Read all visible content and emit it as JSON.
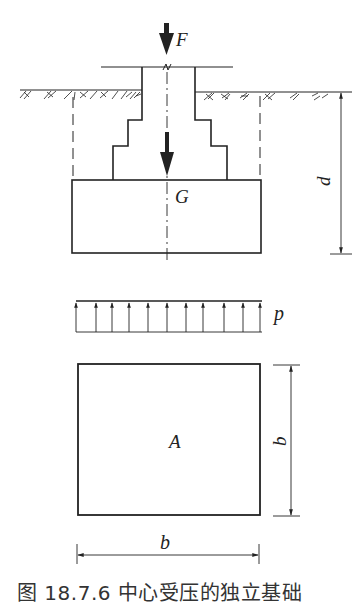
{
  "figure": {
    "caption": "图 18.7.6   中心受压的独立基础",
    "labels": {
      "force_top": "F",
      "self_weight": "G",
      "depth": "d",
      "pressure": "p",
      "area": "A",
      "width_vertical": "b",
      "width_horizontal": "b"
    },
    "colors": {
      "line": "#222222",
      "background": "#ffffff"
    },
    "elevation_view": {
      "description": "Stepped independent footing under column, embedded below ground",
      "column": {
        "left_x": 142,
        "right_x": 195,
        "top_y": 67
      },
      "ground_level_y": 91,
      "steps": [
        {
          "y": 120,
          "left_x": 128,
          "right_x": 211
        },
        {
          "y": 146,
          "left_x": 113,
          "right_x": 227
        }
      ],
      "base": {
        "left_x": 72,
        "right_x": 261,
        "top_y": 180,
        "bottom_y": 253
      },
      "centerline_x": 167
    },
    "pressure_diagram": {
      "type": "uniform",
      "arrow_count": 11,
      "left_x": 76,
      "right_x": 262,
      "top_y": 301,
      "bottom_y": 332
    },
    "plan_view": {
      "shape": "square",
      "left_x": 78,
      "right_x": 260,
      "top_y": 364,
      "bottom_y": 515
    }
  }
}
